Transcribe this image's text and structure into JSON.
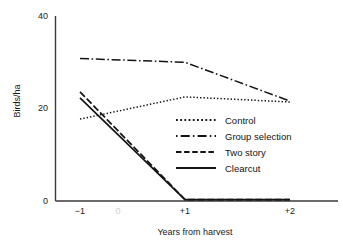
{
  "chart_data": {
    "type": "line",
    "title": "",
    "xlabel": "Years from harvest",
    "ylabel": "Birds/ha",
    "xticklabels": [
      "−1",
      "0",
      "+1",
      "+2"
    ],
    "x": [
      -1,
      1,
      2
    ],
    "ylim": [
      0,
      40
    ],
    "xlim": [
      -1.6,
      2.6
    ],
    "yticks": [
      0,
      20,
      40
    ],
    "yticklabels": [
      "0",
      "20",
      "40"
    ],
    "grid": false,
    "legend_position": "center-right inside axes",
    "series": [
      {
        "name": "Control",
        "style": "dotted",
        "values": [
          17.7,
          22.5,
          21.4
        ]
      },
      {
        "name": "Group selection",
        "style": "dash-dot",
        "values": [
          30.8,
          30.0,
          21.6
        ]
      },
      {
        "name": "Two story",
        "style": "dashed",
        "values": [
          23.6,
          0.3,
          0.3
        ]
      },
      {
        "name": "Clearcut",
        "style": "solid",
        "values": [
          22.3,
          0.3,
          0.3
        ]
      }
    ]
  },
  "axes": {
    "y_tick_0": "0",
    "y_tick_20": "20",
    "y_tick_40": "40",
    "x_tick_minus1": "−1",
    "x_tick_0": "0",
    "x_tick_plus1": "+1",
    "x_tick_plus2": "+2",
    "xlabel": "Years from harvest",
    "ylabel": "Birds/ha"
  },
  "legend": {
    "items": [
      {
        "label": "Control"
      },
      {
        "label": "Group selection"
      },
      {
        "label": "Two story"
      },
      {
        "label": "Clearcut"
      }
    ]
  },
  "colors": {
    "ink": "#141414",
    "background": "#ffffff"
  }
}
